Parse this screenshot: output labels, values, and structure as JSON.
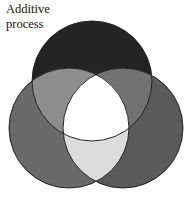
{
  "title": {
    "line1": "Additive",
    "line2": "process"
  },
  "diagram": {
    "type": "venn-three-circle",
    "circles": [
      {
        "name": "top",
        "cx": 92,
        "cy": 81,
        "r": 60,
        "color": "#242424"
      },
      {
        "name": "left",
        "cx": 69,
        "cy": 128,
        "r": 60,
        "color": "#6a6a6a"
      },
      {
        "name": "right",
        "cx": 123,
        "cy": 128,
        "r": 60,
        "color": "#5a5a5a"
      }
    ],
    "overlap_colors": {
      "top_left": "#8e8e8e",
      "top_right": "#727272",
      "left_right": "#dcdcdc",
      "center": "#ffffff"
    },
    "stroke": "#222222"
  }
}
